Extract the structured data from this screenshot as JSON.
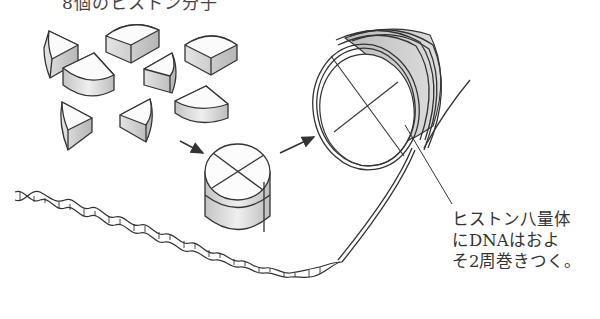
{
  "title": {
    "caption_partial": "8個のヒストン分子"
  },
  "annotation": {
    "lines": [
      "ヒストン八量体",
      "にDNAはおよ",
      "そ2周巻きつく。"
    ]
  },
  "elements": {
    "histone_pieces_count": 8,
    "octamer": "histone-octamer",
    "nucleosome": "nucleosome-dna-wrapped",
    "dna": "dna-double-helix"
  },
  "colors": {
    "stroke": "#333333",
    "shade_light": "#f2f2f2",
    "shade_dark": "#b8b8b8",
    "background": "#ffffff"
  }
}
